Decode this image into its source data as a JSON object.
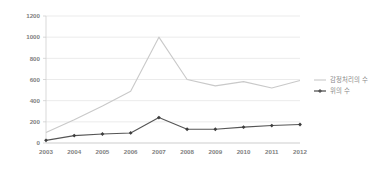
{
  "chart_data": {
    "type": "line",
    "title": "",
    "xlabel": "",
    "ylabel": "",
    "x": [
      "2003",
      "2004",
      "2005",
      "2006",
      "2007",
      "2008",
      "2009",
      "2010",
      "2011",
      "2012"
    ],
    "categories": [
      "2003",
      "2004",
      "2005",
      "2006",
      "2007",
      "2008",
      "2009",
      "2010",
      "2011",
      "2012"
    ],
    "ylim": [
      0,
      1200
    ],
    "yticks": [
      0,
      200,
      400,
      600,
      800,
      1000,
      1200
    ],
    "grid": true,
    "legend_position": "right",
    "series": [
      {
        "name": "감정처리의 수",
        "color": "#c9c9c9",
        "marker": "none",
        "values": [
          100,
          220,
          350,
          490,
          1000,
          600,
          540,
          580,
          520,
          590
        ]
      },
      {
        "name": "위의 수",
        "color": "#555555",
        "marker": "diamond",
        "values": [
          25,
          70,
          85,
          95,
          240,
          130,
          130,
          150,
          165,
          175
        ]
      }
    ]
  },
  "axis": {
    "y_labels": [
      "1200",
      "1000",
      "800",
      "600",
      "400",
      "200",
      "0"
    ],
    "x_labels": [
      "2003",
      "2004",
      "2005",
      "2006",
      "2007",
      "2008",
      "2009",
      "2010",
      "2011",
      "2012"
    ]
  },
  "legend": {
    "items": [
      {
        "label": "감정처리의 수",
        "color": "#c9c9c9",
        "marker": "line"
      },
      {
        "label": "위의 수",
        "color": "#555555",
        "marker": "diamond"
      }
    ]
  },
  "colors": {
    "background": "#ffffff",
    "grid": "#e2e2e2",
    "axis": "#cfcfcf",
    "tick_text": "#808080",
    "legend_text": "#8a8a8a",
    "series_a": "#c9c9c9",
    "series_b": "#555555"
  }
}
